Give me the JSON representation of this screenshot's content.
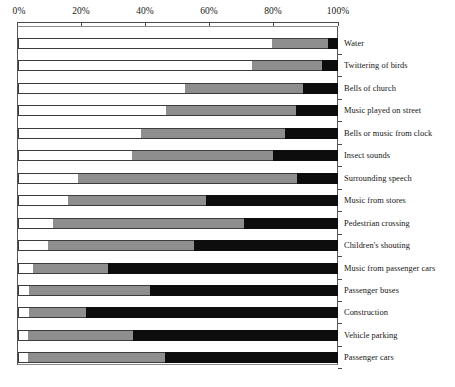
{
  "chart_data": {
    "type": "bar",
    "orientation": "horizontal",
    "stacked": true,
    "title": "",
    "xlabel": "",
    "ylabel": "",
    "xlim": [
      0,
      100
    ],
    "grid": false,
    "legend_position": "none",
    "x_tick_labels": [
      "0%",
      "20%",
      "40%",
      "60%",
      "80%",
      "100%"
    ],
    "x_ticks": [
      0,
      20,
      40,
      60,
      80,
      100
    ],
    "colors": {
      "series_1": "#ffffff",
      "series_2": "#8e8e8e",
      "series_3": "#0d0d0d",
      "axis": "#4a4a4a",
      "outline": "#3c3c3c",
      "text": "#151515",
      "background": "#ffffff"
    },
    "categories": [
      "Water",
      "Twittering of birds",
      "Bells of church",
      "Music played on street",
      "Bells or music from clock",
      "Insect sounds",
      "Surrounding speech",
      "Music from stores",
      "Pedestrian crossing",
      "Children's shouting",
      "Music from passenger cars",
      "Passenger buses",
      "Construction",
      "Vehicle parking",
      "Passenger cars"
    ],
    "series": [
      {
        "name": "series_1",
        "values": [
          79.4,
          73.2,
          52.3,
          46.1,
          38.3,
          35.5,
          18.7,
          15.6,
          10.9,
          9.3,
          4.7,
          3.4,
          3.4,
          3.1,
          3.1
        ]
      },
      {
        "name": "series_2",
        "values": [
          17.4,
          21.8,
          36.8,
          40.8,
          45.2,
          44.2,
          68.5,
          43.3,
          59.8,
          45.8,
          23.4,
          37.7,
          17.8,
          32.7,
          42.7
        ]
      },
      {
        "name": "series_3",
        "values": [
          3.2,
          5.0,
          10.9,
          13.1,
          16.5,
          20.3,
          12.8,
          41.1,
          29.3,
          44.9,
          71.9,
          58.9,
          78.8,
          64.2,
          54.2
        ]
      }
    ],
    "cumulative_boundaries_pct": [
      [
        79.4,
        96.8
      ],
      [
        73.2,
        95.0
      ],
      [
        52.3,
        89.1
      ],
      [
        46.1,
        86.9
      ],
      [
        38.3,
        83.5
      ],
      [
        35.5,
        79.7
      ],
      [
        18.7,
        87.2
      ],
      [
        15.6,
        58.9
      ],
      [
        10.9,
        70.7
      ],
      [
        9.3,
        55.1
      ],
      [
        4.7,
        28.1
      ],
      [
        3.4,
        41.1
      ],
      [
        3.4,
        21.2
      ],
      [
        3.1,
        35.8
      ],
      [
        3.1,
        45.8
      ]
    ]
  }
}
